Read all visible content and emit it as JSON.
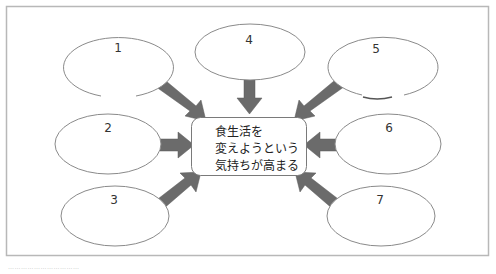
{
  "diagram": {
    "center": {
      "lines": [
        "食生活を",
        "変えようという",
        "気持ちが高まる"
      ]
    },
    "nodes": [
      {
        "label": "1",
        "cx": 118,
        "cy": 67,
        "rx": 55,
        "ry": 30
      },
      {
        "label": "2",
        "cx": 108,
        "cy": 144,
        "rx": 53,
        "ry": 30
      },
      {
        "label": "3",
        "cx": 115,
        "cy": 216,
        "rx": 54,
        "ry": 30
      },
      {
        "label": "4",
        "cx": 250,
        "cy": 52,
        "rx": 55,
        "ry": 28
      },
      {
        "label": "5",
        "cx": 381,
        "cy": 67,
        "rx": 55,
        "ry": 30
      },
      {
        "label": "6",
        "cx": 388,
        "cy": 144,
        "rx": 53,
        "ry": 30
      },
      {
        "label": "7",
        "cx": 381,
        "cy": 216,
        "rx": 54,
        "ry": 30
      }
    ],
    "colors": {
      "arrow": "#6b6b6b",
      "ellipse_stroke": "#8a8a8a",
      "frame": "#b8b8b8"
    }
  },
  "footer": {
    "text": "……………………………"
  }
}
